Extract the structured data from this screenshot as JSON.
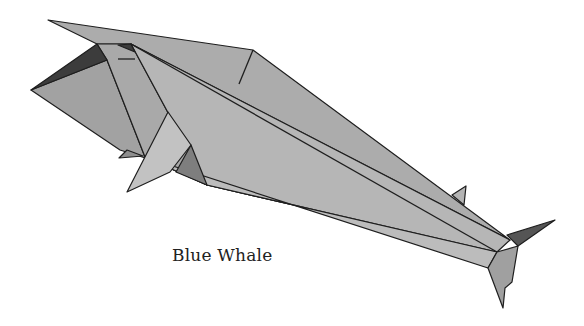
{
  "figure": {
    "caption": "Blue Whale",
    "colors": {
      "background": "#ffffff",
      "body_mid": "#a8a8a8",
      "body_light": "#bdbdbd",
      "body_dark": "#9a9a9a",
      "shadow": "#3a3a3a",
      "fold_line": "#1e1e1e"
    }
  }
}
